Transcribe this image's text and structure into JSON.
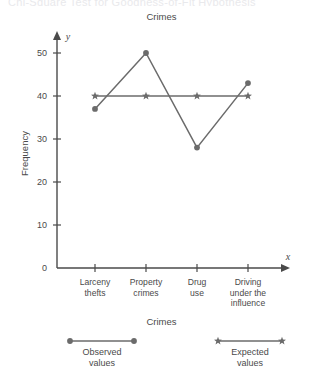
{
  "page": {
    "clipped_header_text": "Chi-Square Test for Goodness-of-Fit Hypothesis"
  },
  "chart_data": {
    "type": "line",
    "title": "Crimes",
    "xlabel": "Crimes",
    "ylabel": "Frequency",
    "axis_letters": {
      "x": "x",
      "y": "y"
    },
    "categories": [
      "Larceny thefts",
      "Property crimes",
      "Drug use",
      "Driving under the influence"
    ],
    "category_lines": [
      [
        "Larceny",
        "thefts"
      ],
      [
        "Property",
        "crimes"
      ],
      [
        "Drug",
        "use"
      ],
      [
        "Driving",
        "under the",
        "influence"
      ]
    ],
    "yticks": [
      0,
      10,
      20,
      30,
      40,
      50
    ],
    "ylim": [
      0,
      55
    ],
    "grid": false,
    "legend_position": "bottom",
    "series": [
      {
        "name": "Observed values",
        "name_lines": [
          "Observed",
          "values"
        ],
        "marker": "circle",
        "color": "#6b6b6b",
        "values": [
          37,
          50,
          28,
          43
        ]
      },
      {
        "name": "Expected values",
        "name_lines": [
          "Expected",
          "values"
        ],
        "marker": "star",
        "color": "#6b6b6b",
        "values": [
          40,
          40,
          40,
          40
        ]
      }
    ]
  },
  "colors": {
    "axis": "#4a4a4a",
    "series": "#6b6b6b",
    "text": "#4a4a4a",
    "background": "#ffffff"
  }
}
